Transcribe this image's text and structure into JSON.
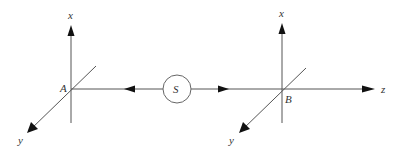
{
  "diagram": {
    "source_label": "S",
    "frame_a": {
      "origin": "A",
      "axes": {
        "x": "x",
        "y": "y"
      }
    },
    "frame_b": {
      "origin": "B",
      "axes": {
        "x": "x",
        "y": "y",
        "z": "z"
      }
    }
  }
}
